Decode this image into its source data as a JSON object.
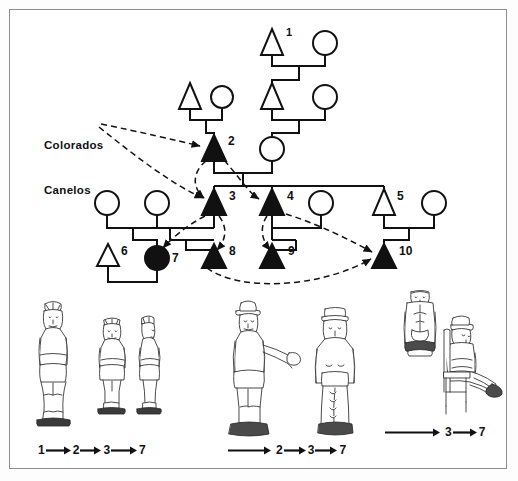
{
  "figure": {
    "type": "kinship-pedigree-diagram",
    "title": "",
    "border_color": "#8d8d8d",
    "background": "#ffffff",
    "ink_color": "#111111"
  },
  "annotation": {
    "label_line1": "Colorados",
    "label_line2": "Canelos",
    "full_label": "Colorados Canelos",
    "arrow_style": "dashed",
    "targets": [
      2,
      3
    ]
  },
  "pedigree": {
    "symbol_legend": {
      "triangle_open": "male (unaffected)",
      "triangle_filled": "male (affected / carver)",
      "circle_open": "female (unaffected)",
      "circle_filled": "female (affected / carver)"
    },
    "individuals": [
      {
        "id": 1,
        "label": "1",
        "sex": "male",
        "shape": "triangle",
        "filled": false,
        "generation": 1,
        "x": 272,
        "y": 42,
        "label_dx": 17,
        "label_dy": -9
      },
      {
        "id": null,
        "label": "",
        "sex": "female",
        "shape": "circle",
        "filled": false,
        "generation": 1,
        "x": 325,
        "y": 42
      },
      {
        "id": null,
        "label": "",
        "sex": "male",
        "shape": "triangle",
        "filled": false,
        "generation": 2,
        "x": 190,
        "y": 96
      },
      {
        "id": null,
        "label": "",
        "sex": "female",
        "shape": "circle",
        "filled": false,
        "generation": 2,
        "x": 222,
        "y": 96
      },
      {
        "id": null,
        "label": "",
        "sex": "male",
        "shape": "triangle",
        "filled": false,
        "generation": 2,
        "x": 272,
        "y": 96
      },
      {
        "id": null,
        "label": "",
        "sex": "female",
        "shape": "circle",
        "filled": false,
        "generation": 2,
        "x": 325,
        "y": 96
      },
      {
        "id": 2,
        "label": "2",
        "sex": "male",
        "shape": "triangle",
        "filled": true,
        "generation": 3,
        "x": 214,
        "y": 148,
        "label_dx": 15,
        "label_dy": -8
      },
      {
        "id": null,
        "label": "",
        "sex": "female",
        "shape": "circle",
        "filled": false,
        "generation": 3,
        "x": 272,
        "y": 148
      },
      {
        "id": null,
        "label": "",
        "sex": "female",
        "shape": "circle",
        "filled": false,
        "generation": 4,
        "x": 107,
        "y": 202
      },
      {
        "id": null,
        "label": "",
        "sex": "female",
        "shape": "circle",
        "filled": false,
        "generation": 4,
        "x": 157,
        "y": 202
      },
      {
        "id": 3,
        "label": "3",
        "sex": "male",
        "shape": "triangle",
        "filled": true,
        "generation": 4,
        "x": 214,
        "y": 202,
        "label_dx": 15,
        "label_dy": -8
      },
      {
        "id": 4,
        "label": "4",
        "sex": "male",
        "shape": "triangle",
        "filled": true,
        "generation": 4,
        "x": 272,
        "y": 202,
        "label_dx": 15,
        "label_dy": -8
      },
      {
        "id": null,
        "label": "",
        "sex": "female",
        "shape": "circle",
        "filled": false,
        "generation": 4,
        "x": 321,
        "y": 202
      },
      {
        "id": 5,
        "label": "5",
        "sex": "male",
        "shape": "triangle",
        "filled": false,
        "generation": 4,
        "x": 384,
        "y": 202,
        "label_dx": 15,
        "label_dy": -8
      },
      {
        "id": null,
        "label": "",
        "sex": "female",
        "shape": "circle",
        "filled": false,
        "generation": 4,
        "x": 434,
        "y": 202
      },
      {
        "id": 6,
        "label": "6",
        "sex": "male",
        "shape": "triangle",
        "filled": false,
        "generation": 5,
        "x": 108,
        "y": 257,
        "label_dx": 15,
        "label_dy": -8
      },
      {
        "id": 7,
        "label": "7",
        "sex": "female",
        "shape": "circle",
        "filled": true,
        "generation": 5,
        "x": 157,
        "y": 257,
        "label_dx": 15,
        "label_dy": 1
      },
      {
        "id": 8,
        "label": "8",
        "sex": "male",
        "shape": "triangle",
        "filled": true,
        "generation": 5,
        "x": 214,
        "y": 257,
        "label_dx": 15,
        "label_dy": -8
      },
      {
        "id": 9,
        "label": "9",
        "sex": "male",
        "shape": "triangle",
        "filled": true,
        "generation": 5,
        "x": 272,
        "y": 257,
        "label_dx": 15,
        "label_dy": -8
      },
      {
        "id": 10,
        "label": "10",
        "sex": "male",
        "shape": "triangle",
        "filled": true,
        "generation": 5,
        "x": 384,
        "y": 257,
        "label_dx": 15,
        "label_dy": -8
      }
    ],
    "transmission_arrows": [
      {
        "from": "Colorados Canelos",
        "to": 2
      },
      {
        "from": "Colorados Canelos",
        "to": 3
      },
      {
        "from": 2,
        "to": 3
      },
      {
        "from": 2,
        "to": 4
      },
      {
        "from": 3,
        "to": 7
      },
      {
        "from": 3,
        "to": 8
      },
      {
        "from": 4,
        "to": 9
      },
      {
        "from": 4,
        "to": 10
      },
      {
        "from": 3,
        "to": 10
      }
    ]
  },
  "figurines": {
    "groups": [
      {
        "name": "group-1",
        "figures": [
          "standing-male-front",
          "standing-female-front",
          "standing-female-profile"
        ],
        "caption_tokens": [
          "1",
          "2",
          "3",
          "7"
        ],
        "caption_text": "1 → 2 → 3 → 7",
        "leading_arrow": false
      },
      {
        "name": "group-2",
        "figures": [
          "standing-male-hat-outstretched-arm",
          "standing-female-cap"
        ],
        "caption_tokens": [
          "2",
          "3",
          "7"
        ],
        "caption_text": "→ 2 → 3 → 7",
        "leading_arrow": true
      },
      {
        "name": "group-3",
        "figures": [
          "standing-robed-figure",
          "seated-figure-on-chair"
        ],
        "caption_tokens": [
          "3",
          "7"
        ],
        "caption_text": "→ 3 → 7",
        "leading_arrow": true
      }
    ]
  }
}
